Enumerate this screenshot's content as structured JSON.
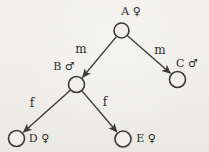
{
  "figure": {
    "type": "tree-diagram",
    "background_color": "#efeee9",
    "ink_color": "#3b3a37",
    "nodes": [
      {
        "id": "A",
        "label": "A ♀",
        "sex": "female"
      },
      {
        "id": "B",
        "label": "B ♂",
        "sex": "male"
      },
      {
        "id": "C",
        "label": "C ♂",
        "sex": "male"
      },
      {
        "id": "D",
        "label": "D ♀",
        "sex": "female"
      },
      {
        "id": "E",
        "label": "E ♀",
        "sex": "female"
      }
    ],
    "edges": [
      {
        "from": "A",
        "to": "B",
        "label": "m"
      },
      {
        "from": "A",
        "to": "C",
        "label": "m"
      },
      {
        "from": "B",
        "to": "D",
        "label": "f"
      },
      {
        "from": "B",
        "to": "E",
        "label": "f"
      }
    ]
  }
}
